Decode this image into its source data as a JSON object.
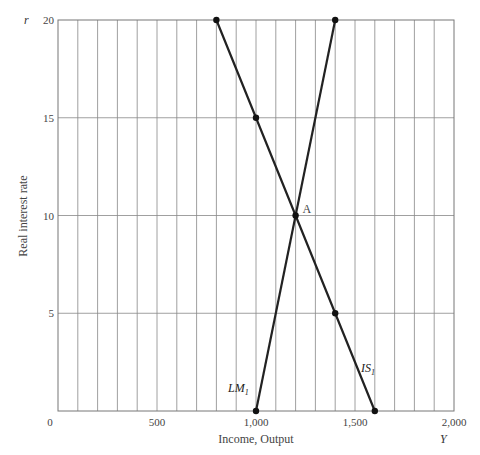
{
  "chart_data": {
    "type": "line",
    "title": "",
    "xlabel": "Income, Output",
    "ylabel": "Real interest rate",
    "x_axis_symbol": "Y",
    "y_axis_symbol": "r",
    "xlim": [
      0,
      2000
    ],
    "ylim": [
      0,
      20
    ],
    "x_ticks": [
      0,
      500,
      1000,
      1500,
      2000
    ],
    "x_tick_labels": [
      "0",
      "500",
      "1,000",
      "1,500",
      "2,000"
    ],
    "y_ticks": [
      5,
      10,
      15,
      20
    ],
    "y_tick_labels": [
      "5",
      "10",
      "15",
      "20"
    ],
    "x_grid_step": 100,
    "y_grid_step": 5,
    "grid": true,
    "series": [
      {
        "name": "LM1",
        "label": "LM",
        "subscript": "1",
        "points": [
          [
            1000,
            0
          ],
          [
            1400,
            20
          ]
        ]
      },
      {
        "name": "IS1",
        "label": "IS",
        "subscript": "1",
        "points": [
          [
            800,
            20
          ],
          [
            1000,
            15
          ],
          [
            1200,
            10
          ],
          [
            1400,
            5
          ],
          [
            1600,
            0
          ]
        ]
      }
    ],
    "annotations": [
      {
        "text": "A",
        "x": 1200,
        "y": 10
      }
    ]
  }
}
